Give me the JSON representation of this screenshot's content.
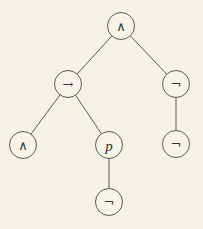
{
  "diagram": {
    "type": "syntax-tree",
    "colors": {
      "background": "#f4f1e6",
      "stroke": "#5a5a5a",
      "text": "#333333"
    },
    "nodes": [
      {
        "id": "n0",
        "label": "∧",
        "kind": "operator",
        "x": 121,
        "y": 26
      },
      {
        "id": "n1",
        "label": "→",
        "kind": "operator",
        "x": 68,
        "y": 84
      },
      {
        "id": "n2",
        "label": "¬",
        "kind": "operator",
        "x": 176,
        "y": 84
      },
      {
        "id": "n3",
        "label": "∧",
        "kind": "operator",
        "x": 23,
        "y": 145
      },
      {
        "id": "n4",
        "label": "p",
        "kind": "variable",
        "x": 109,
        "y": 145
      },
      {
        "id": "n5",
        "label": "¬",
        "kind": "operator",
        "x": 176,
        "y": 144
      },
      {
        "id": "n6",
        "label": "¬",
        "kind": "operator",
        "x": 109,
        "y": 202
      }
    ],
    "edges": [
      {
        "from": "n0",
        "to": "n1"
      },
      {
        "from": "n0",
        "to": "n2"
      },
      {
        "from": "n1",
        "to": "n3"
      },
      {
        "from": "n1",
        "to": "n4"
      },
      {
        "from": "n2",
        "to": "n5"
      },
      {
        "from": "n4",
        "to": "n6"
      }
    ],
    "node_radius": 13.5
  }
}
